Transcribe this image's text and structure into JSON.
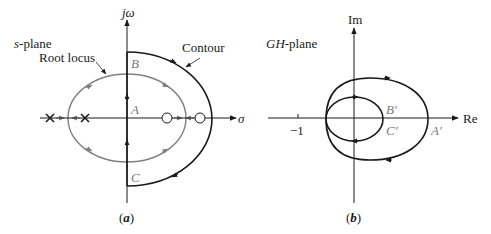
{
  "panel_a": {
    "plane_label_italic": "s",
    "plane_label_rest": "-plane",
    "root_locus_label": "Root locus",
    "contour_label": "Contour",
    "vertical_axis_label": "jω",
    "horizontal_axis_label": "σ",
    "point_A": "A",
    "point_B": "B",
    "point_C": "C",
    "caption": "(a)",
    "poles": 2,
    "zeros": 2
  },
  "panel_b": {
    "plane_label_italic": "GH",
    "plane_label_rest": "-plane",
    "vertical_axis_label": "Im",
    "horizontal_axis_label": "Re",
    "tick_label": "−1",
    "point_A": "A′",
    "point_B": "B′",
    "point_C": "C′",
    "caption": "(b)"
  },
  "colors": {
    "axis": "#1a1a1a",
    "contour": "#1a1a1a",
    "root_locus": "#808080",
    "label_grey": "#7a7a7a"
  }
}
